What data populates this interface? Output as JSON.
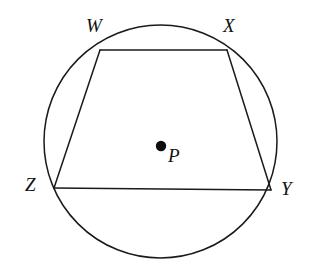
{
  "figure": {
    "type": "geometry-diagram",
    "background_color": "#ffffff",
    "stroke_color": "#1a1a1a",
    "stroke_width": 1.4,
    "circle": {
      "name": "circle-p",
      "center_label": "P",
      "center_x": 160.5,
      "center_y": 141.5,
      "radius": 116.5
    },
    "center_dot": {
      "name": "point-p",
      "x": 161,
      "y": 146,
      "radius": 5.2,
      "fill": "#0d0d0d"
    },
    "vertices": [
      {
        "label": "W",
        "x": 100,
        "y": 50,
        "label_x": 86,
        "label_y": 16
      },
      {
        "label": "X",
        "x": 227,
        "y": 50,
        "label_x": 223,
        "label_y": 16
      },
      {
        "label": "Y",
        "x": 271,
        "y": 190,
        "label_x": 281,
        "label_y": 179
      },
      {
        "label": "Z",
        "x": 54,
        "y": 188,
        "label_x": 25,
        "label_y": 175
      }
    ],
    "edges": [
      {
        "name": "segment-wx",
        "from": "W",
        "to": "X"
      },
      {
        "name": "segment-xy",
        "from": "X",
        "to": "Y"
      },
      {
        "name": "segment-yz",
        "from": "Y",
        "to": "Z"
      },
      {
        "name": "segment-zw",
        "from": "Z",
        "to": "W"
      }
    ],
    "center_point_label": "P",
    "labels": {
      "w": "W",
      "x": "X",
      "y": "Y",
      "z": "Z",
      "p": "P"
    }
  }
}
